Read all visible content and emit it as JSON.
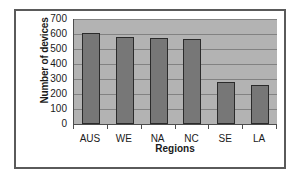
{
  "chart_data": {
    "type": "bar",
    "title": "",
    "xlabel": "Regions",
    "ylabel": "Number of devices",
    "categories": [
      "AUS",
      "WE",
      "NA",
      "NC",
      "SE",
      "LA"
    ],
    "values": [
      605,
      580,
      575,
      565,
      280,
      262
    ],
    "ylim": [
      0,
      700
    ],
    "yticks": [
      0,
      100,
      200,
      300,
      400,
      500,
      600,
      700
    ],
    "ytick_labels": [
      "0",
      "100",
      "200",
      "300",
      "400",
      "500",
      "600",
      "700"
    ],
    "grid": true,
    "legend": false,
    "colors": {
      "bar_fill": "#777777",
      "bar_outline": "#2b2b2b",
      "plot_background": "#b3b3b3",
      "gridline": "#828282",
      "axis": "#4d4d4d",
      "frame_border": "#5a5a5a",
      "page_background": "#ffffff",
      "text": "#1a1a1a"
    }
  }
}
